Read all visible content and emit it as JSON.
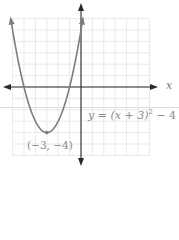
{
  "chart_data": {
    "type": "line",
    "title": "",
    "function": "y = (x+3)^2 - 4",
    "xlabel": "x",
    "ylabel": "",
    "xlim": [
      -6,
      6
    ],
    "ylim": [
      -6,
      6
    ],
    "grid": true,
    "series": [
      {
        "name": "y = (x + 3)^2 - 4",
        "x": [
          -6.1,
          -6,
          -5,
          -4,
          -3,
          -2,
          -1,
          0,
          0.1
        ],
        "y": [
          5.61,
          5,
          0,
          -3,
          -4,
          -3,
          0,
          5,
          5.61
        ]
      }
    ],
    "annotations": [
      {
        "label": "(−3, −4)",
        "x": -3,
        "y": -4,
        "type": "vertex"
      }
    ]
  },
  "labels": {
    "x_axis": "x",
    "equation": "y = (x + 3)",
    "equation_exp": "2",
    "equation_tail": " − 4",
    "vertex": "(−3, −4)"
  },
  "colors": {
    "grid": "#e3e3e3",
    "axis": "#2a2a2a",
    "curve": "#7d7d7d",
    "text": "#8a8a8a"
  }
}
